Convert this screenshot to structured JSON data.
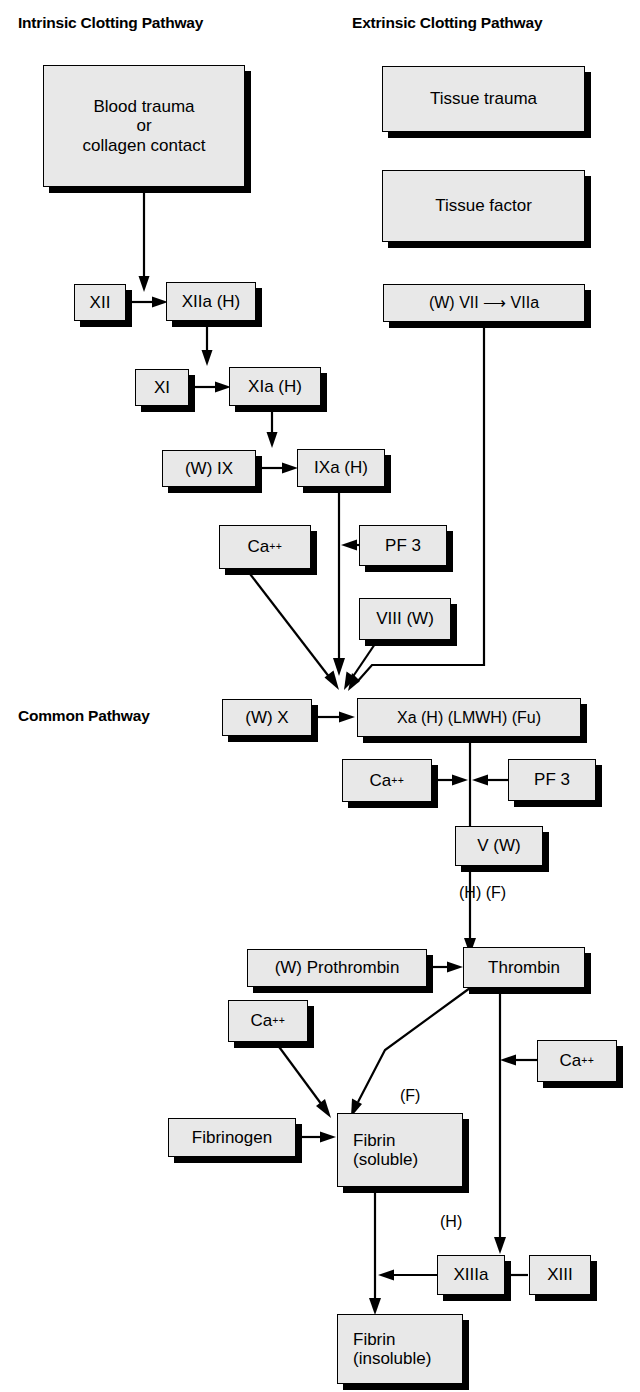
{
  "headings": {
    "intrinsic": "Intrinsic Clotting Pathway",
    "extrinsic": "Extrinsic Clotting Pathway",
    "common": "Common Pathway"
  },
  "boxes": {
    "blood_trauma": "Blood trauma\nor\ncollagen contact",
    "tissue_trauma": "Tissue trauma",
    "tissue_factor": "Tissue factor",
    "factor_vii": "(W)   VII ⟶ VIIa",
    "factor_xii": "XII",
    "factor_xiia": "XIIa (H)",
    "factor_xi": "XI",
    "factor_xia": "XIa  (H)",
    "factor_ix": "(W)  IX",
    "factor_ixa": "IXa  (H)",
    "calcium_1": "Ca",
    "pf3_1": "PF    3",
    "factor_viii": "VIII  (W)",
    "factor_x": "(W)  X",
    "factor_xa": "Xa (H) (LMWH) (Fu)",
    "calcium_2": "Ca",
    "pf3_2": "PF    3",
    "factor_v": "V   (W)",
    "prothrombin": "(W) Prothrombin",
    "thrombin": "Thrombin",
    "calcium_3": "Ca",
    "calcium_4": "Ca",
    "fibrinogen": "Fibrinogen",
    "fibrin_soluble": "Fibrin\n(soluble)",
    "factor_xiiia": "XIIIa",
    "factor_xiii": "XIII",
    "fibrin_insoluble": "Fibrin\n(insoluble)"
  },
  "annotations": {
    "thrombin_hf": "(H)  (F)",
    "fibrin_f": "(F)",
    "xiiia_h": "(H)"
  },
  "superscript": {
    "calcium_charge": "++"
  },
  "colors": {
    "box_fill": "#e8e8e8",
    "box_border": "#000000",
    "shadow": "#000000",
    "text": "#000000",
    "background": "#ffffff"
  }
}
